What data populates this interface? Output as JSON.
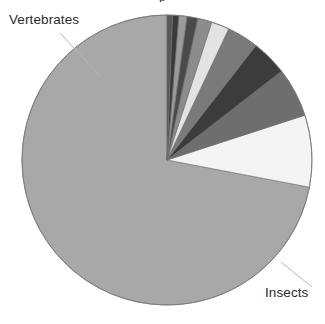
{
  "figure": {
    "title_partial": "p",
    "background_color": "#ffffff",
    "text_color": "#2b2b2b"
  },
  "labels": {
    "vertebrates": "Vertebrates",
    "insects": "Insects"
  },
  "geometry": {
    "center_x": 167,
    "center_y": 160,
    "radius": 145,
    "start_angle_deg": 0,
    "direction": "counterclockwise"
  },
  "leader_lines": {
    "vertebrates": {
      "x1": 60,
      "y1": 33,
      "x2": 100,
      "y2": 76,
      "color": "#b6b6b6"
    },
    "insects": {
      "x1": 281,
      "y1": 262,
      "x2": 312,
      "y2": 287,
      "color": "#b6b6b6"
    }
  },
  "chart_data": {
    "type": "pie",
    "title": "",
    "xlabel": "",
    "ylabel": "",
    "legend_position": "none",
    "grid": false,
    "labeled_slices": [
      "Insects",
      "Vertebrates"
    ],
    "categories": [
      "Insects",
      "Vertebrates",
      "Molluscs",
      "Crustaceans",
      "Arachnids",
      "Other invertebrates",
      "Plants",
      "Fungi",
      "Algae",
      "Protozoa",
      "Bacteria"
    ],
    "values": [
      72.0,
      8.0,
      5.5,
      4.0,
      3.5,
      2.0,
      1.6,
      1.2,
      0.9,
      0.7,
      0.6
    ],
    "unit": "percent",
    "colors": [
      "#a8a8a8",
      "#f4f4f4",
      "#6e6e6e",
      "#3c3c3c",
      "#7a7a7a",
      "#e3e3e3",
      "#8c8c8c",
      "#4a4a4a",
      "#9a9a9a",
      "#3a3a3a",
      "#585858"
    ],
    "slice_border_color": "#6b6b6b",
    "slice_border_width": 0.6
  }
}
